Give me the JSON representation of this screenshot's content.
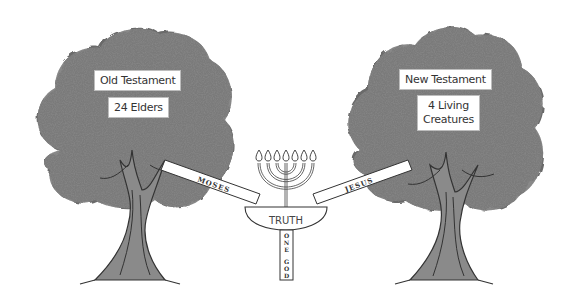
{
  "diagram": {
    "left_tree": {
      "title": "Old Testament",
      "subtitle": "24 Elders"
    },
    "right_tree": {
      "title": "New Testament",
      "subtitle_line1": "4 Living",
      "subtitle_line2": "Creatures"
    },
    "left_beam": "MOSES",
    "right_beam": "JESUS",
    "bowl_label": "TRUTH",
    "pillar_letters": [
      "O",
      "N",
      "E",
      "G",
      "O",
      "D"
    ],
    "menorah_flames": 7,
    "colors": {
      "foliage_dark": "#4a4a4a",
      "foliage_mid": "#6e6e6e",
      "foliage_light": "#9a9a9a",
      "trunk": "#5a5a5a",
      "outline": "#333333",
      "background": "#ffffff"
    }
  }
}
